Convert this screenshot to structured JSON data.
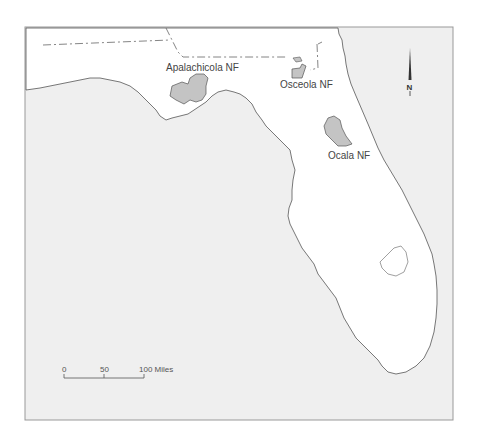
{
  "map": {
    "region": "Florida",
    "colors": {
      "water": "#efefef",
      "land": "#ffffff",
      "forest": "#c4c4c4",
      "outline": "#555555",
      "border": "#888888",
      "frame": "#999999"
    },
    "labels": {
      "apalachicola": "Apalachicola NF",
      "osceola": "Osceola NF",
      "ocala": "Ocala NF"
    },
    "north_arrow": {
      "label": "N"
    },
    "scale_bar": {
      "ticks": [
        "0",
        "50",
        "100 Miles"
      ]
    }
  }
}
